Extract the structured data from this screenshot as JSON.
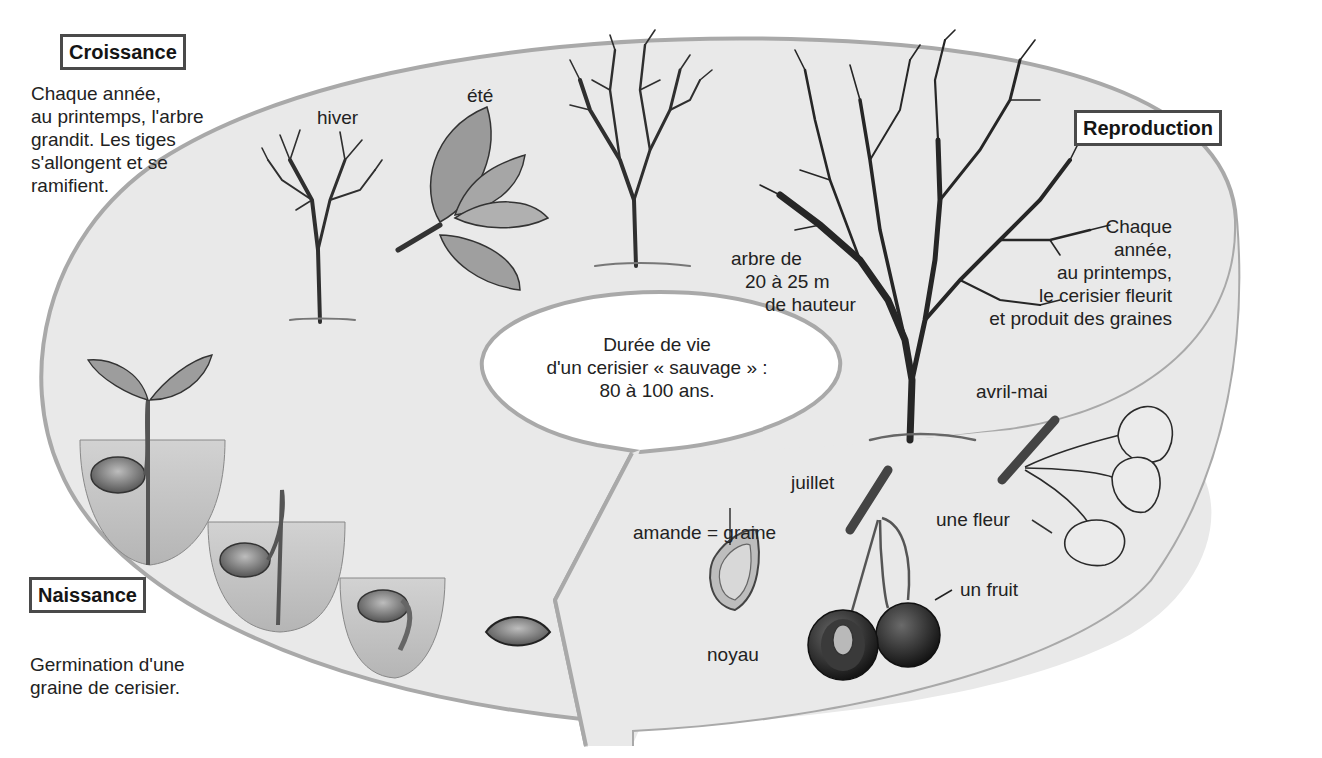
{
  "diagram": {
    "type": "life-cycle",
    "subject": "cerisier",
    "colors": {
      "ellipse_fill": "#e9e9e9",
      "ellipse_stroke": "#a9a9a9",
      "box_border": "#4a4a4a",
      "text": "#222222",
      "ink": "#2a2a2a"
    }
  },
  "stages": {
    "croissance": {
      "title": "Croissance",
      "text": [
        "Chaque année,",
        "au printemps, l'arbre",
        "grandit. Les tiges",
        "s'allongent et se",
        "ramifient."
      ],
      "labels": {
        "winter": "hiver",
        "summer": "été"
      }
    },
    "reproduction": {
      "title": "Reproduction",
      "text": [
        "Chaque",
        "année,",
        "au printemps,",
        "le cerisier fleurit",
        "et produit des graines"
      ],
      "tree_size": [
        "arbre de",
        "20 à 25 m",
        "de hauteur"
      ],
      "labels": {
        "flower_season": "avril-mai",
        "flower": "une fleur",
        "fruit_season": "juillet",
        "fruit": "un fruit",
        "seed": "amande = graine",
        "pit": "noyau"
      }
    },
    "naissance": {
      "title": "Naissance",
      "text": [
        "Germination d'une",
        "graine de cerisier."
      ]
    }
  },
  "center_bubble": {
    "lines": [
      "Durée de vie",
      "d'un cerisier « sauvage » :",
      "80 à 100 ans."
    ]
  }
}
